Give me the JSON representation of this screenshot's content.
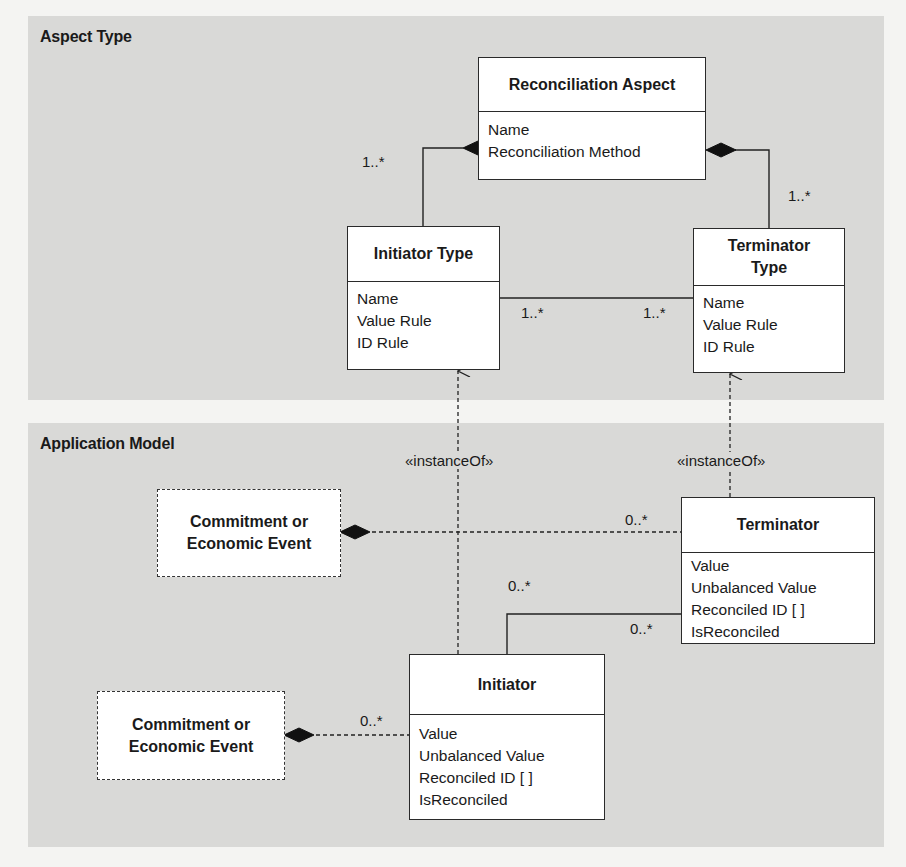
{
  "panels": {
    "top": {
      "title": "Aspect Type"
    },
    "bottom": {
      "title": "Application Model"
    }
  },
  "classes": {
    "reconciliation_aspect": {
      "name": "Reconciliation Aspect",
      "attributes": [
        "Name",
        "Reconciliation Method"
      ]
    },
    "initiator_type": {
      "name": "Initiator Type",
      "attributes": [
        "Name",
        "Value Rule",
        "ID Rule"
      ]
    },
    "terminator_type": {
      "name_line1": "Terminator",
      "name_line2": "Type",
      "attributes": [
        "Name",
        "Value Rule",
        "ID Rule"
      ]
    },
    "terminator": {
      "name": "Terminator",
      "attributes": [
        "Value",
        "Unbalanced Value",
        "Reconciled ID [ ]",
        "IsReconciled"
      ]
    },
    "initiator": {
      "name": "Initiator",
      "attributes": [
        "Value",
        "Unbalanced Value",
        "Reconciled ID [ ]",
        "IsReconciled"
      ]
    },
    "event_top": {
      "line1": "Commitment or",
      "line2": "Economic Event"
    },
    "event_bottom": {
      "line1": "Commitment or",
      "line2": "Economic Event"
    }
  },
  "multiplicities": {
    "aspect_to_initiator_type": "1..*",
    "aspect_to_terminator_type": "1..*",
    "initiator_type_to_terminator_type_left": "1..*",
    "initiator_type_to_terminator_type_right": "1..*",
    "event_top_to_terminator": "0..*",
    "initiator_to_terminator_initiator_end": "0..*",
    "initiator_to_terminator_terminator_end": "0..*",
    "event_bottom_to_initiator": "0..*"
  },
  "stereotypes": {
    "initiator_instance_of": "«instanceOf»",
    "terminator_instance_of": "«instanceOf»"
  }
}
